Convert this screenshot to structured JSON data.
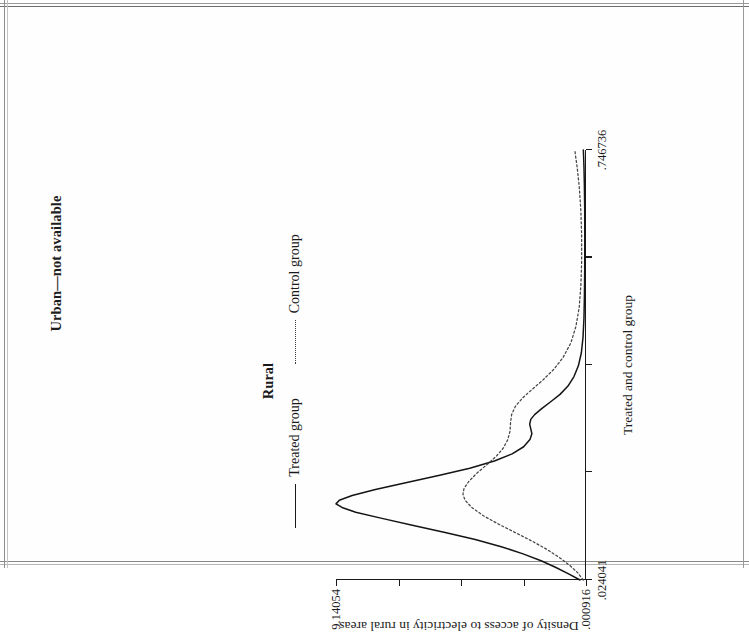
{
  "page": {
    "panel_label": "Urban—not available"
  },
  "legend": {
    "heading": "Rural",
    "items": [
      {
        "label": "Treated group",
        "style": "solid"
      },
      {
        "label": "Control group",
        "style": "dotted"
      }
    ]
  },
  "chart_data": {
    "type": "line",
    "title": "",
    "xlabel": "Treated and control group",
    "ylabel": "Density of access to electricity in rural areas",
    "xlim": [
      0.024041,
      0.746736
    ],
    "ylim": [
      0.000916,
      9.14054
    ],
    "grid": false,
    "legend_position": "top-center",
    "x_ticks": [
      0.024041,
      0.204715,
      0.385389,
      0.566062,
      0.746736
    ],
    "x_tick_labels": [
      ".024041",
      "",
      "",
      "",
      ".746736"
    ],
    "y_ticks": [
      0.000916,
      2.285822,
      4.570728,
      6.855634,
      9.14054
    ],
    "y_tick_labels": [
      ".000916",
      "",
      "",
      "",
      "9.14054"
    ],
    "series": [
      {
        "name": "Treated group",
        "style": "solid",
        "points": [
          [
            0.024041,
            0.22
          ],
          [
            0.034,
            0.62
          ],
          [
            0.045,
            1.1
          ],
          [
            0.056,
            1.62
          ],
          [
            0.068,
            2.3
          ],
          [
            0.08,
            3.1
          ],
          [
            0.092,
            4.05
          ],
          [
            0.104,
            5.15
          ],
          [
            0.116,
            6.35
          ],
          [
            0.128,
            7.5
          ],
          [
            0.138,
            8.42
          ],
          [
            0.146,
            8.92
          ],
          [
            0.152,
            9.14054
          ],
          [
            0.158,
            9.02
          ],
          [
            0.166,
            8.55
          ],
          [
            0.176,
            7.7
          ],
          [
            0.188,
            6.55
          ],
          [
            0.2,
            5.35
          ],
          [
            0.212,
            4.25
          ],
          [
            0.224,
            3.35
          ],
          [
            0.236,
            2.7
          ],
          [
            0.248,
            2.28
          ],
          [
            0.26,
            2.05
          ],
          [
            0.27,
            1.98
          ],
          [
            0.278,
            2.02
          ],
          [
            0.286,
            2.06
          ],
          [
            0.294,
            2.02
          ],
          [
            0.302,
            1.88
          ],
          [
            0.312,
            1.62
          ],
          [
            0.324,
            1.28
          ],
          [
            0.336,
            0.95
          ],
          [
            0.35,
            0.66
          ],
          [
            0.366,
            0.44
          ],
          [
            0.384,
            0.28
          ],
          [
            0.406,
            0.17
          ],
          [
            0.432,
            0.11
          ],
          [
            0.464,
            0.075
          ],
          [
            0.502,
            0.058
          ],
          [
            0.546,
            0.048
          ],
          [
            0.596,
            0.045
          ],
          [
            0.646,
            0.048
          ],
          [
            0.688,
            0.06
          ],
          [
            0.718,
            0.075
          ],
          [
            0.738,
            0.09
          ],
          [
            0.746736,
            0.098
          ]
        ]
      },
      {
        "name": "Control group",
        "style": "dotted",
        "points": [
          [
            0.024041,
            0.1
          ],
          [
            0.036,
            0.3
          ],
          [
            0.048,
            0.58
          ],
          [
            0.062,
            0.98
          ],
          [
            0.076,
            1.45
          ],
          [
            0.09,
            2.0
          ],
          [
            0.104,
            2.6
          ],
          [
            0.118,
            3.2
          ],
          [
            0.132,
            3.75
          ],
          [
            0.146,
            4.18
          ],
          [
            0.158,
            4.42
          ],
          [
            0.168,
            4.5
          ],
          [
            0.178,
            4.46
          ],
          [
            0.19,
            4.28
          ],
          [
            0.204,
            3.98
          ],
          [
            0.218,
            3.62
          ],
          [
            0.232,
            3.28
          ],
          [
            0.246,
            3.02
          ],
          [
            0.26,
            2.86
          ],
          [
            0.274,
            2.78
          ],
          [
            0.288,
            2.76
          ],
          [
            0.302,
            2.72
          ],
          [
            0.316,
            2.58
          ],
          [
            0.33,
            2.32
          ],
          [
            0.344,
            1.98
          ],
          [
            0.36,
            1.58
          ],
          [
            0.378,
            1.18
          ],
          [
            0.398,
            0.84
          ],
          [
            0.422,
            0.56
          ],
          [
            0.45,
            0.37
          ],
          [
            0.482,
            0.25
          ],
          [
            0.518,
            0.19
          ],
          [
            0.558,
            0.16
          ],
          [
            0.602,
            0.16
          ],
          [
            0.646,
            0.19
          ],
          [
            0.686,
            0.25
          ],
          [
            0.716,
            0.32
          ],
          [
            0.736,
            0.38
          ],
          [
            0.746736,
            0.41
          ]
        ]
      }
    ]
  }
}
